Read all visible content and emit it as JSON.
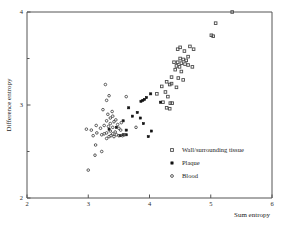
{
  "chart_data": {
    "type": "scatter",
    "title": "",
    "xlabel": "Sum entropy",
    "ylabel": "Difference entropy",
    "xlim": [
      2,
      6
    ],
    "ylim": [
      2,
      4
    ],
    "xticks": [
      2,
      3,
      4,
      5,
      6
    ],
    "yticks": [
      2,
      3,
      4
    ],
    "xticklabels": [
      "2",
      "3",
      "4",
      "5",
      "6"
    ],
    "yticklabels": [
      "2",
      "3",
      "4"
    ],
    "grid": false,
    "legend_position": "lower-right-inside",
    "series": [
      {
        "name": "Wall/surrounding tissue",
        "marker": "open-square",
        "color": "#4a4a4a",
        "points": [
          [
            5.35,
            4.0
          ],
          [
            5.08,
            3.88
          ],
          [
            5.01,
            3.75
          ],
          [
            5.04,
            3.74
          ],
          [
            4.66,
            3.63
          ],
          [
            4.72,
            3.6
          ],
          [
            4.5,
            3.62
          ],
          [
            4.46,
            3.6
          ],
          [
            4.57,
            3.58
          ],
          [
            4.63,
            3.52
          ],
          [
            4.5,
            3.5
          ],
          [
            4.55,
            3.49
          ],
          [
            4.6,
            3.48
          ],
          [
            4.46,
            3.46
          ],
          [
            4.52,
            3.45
          ],
          [
            4.58,
            3.44
          ],
          [
            4.63,
            3.43
          ],
          [
            4.44,
            3.42
          ],
          [
            4.4,
            3.46
          ],
          [
            4.49,
            3.41
          ],
          [
            4.42,
            3.38
          ],
          [
            4.52,
            3.36
          ],
          [
            4.7,
            3.41
          ],
          [
            4.36,
            3.3
          ],
          [
            4.47,
            3.29
          ],
          [
            4.55,
            3.27
          ],
          [
            4.28,
            3.25
          ],
          [
            4.33,
            3.22
          ],
          [
            4.2,
            3.2
          ],
          [
            4.44,
            3.19
          ],
          [
            4.26,
            3.14
          ],
          [
            4.12,
            3.12
          ],
          [
            4.36,
            3.23
          ],
          [
            4.3,
            3.09
          ],
          [
            4.22,
            3.03
          ],
          [
            4.34,
            3.02
          ],
          [
            4.37,
            3.02
          ],
          [
            4.28,
            2.97
          ],
          [
            4.33,
            2.96
          ]
        ]
      },
      {
        "name": "Plaque",
        "marker": "filled-square",
        "color": "#111111",
        "points": [
          [
            4.02,
            3.12
          ],
          [
            3.95,
            3.08
          ],
          [
            3.92,
            3.06
          ],
          [
            3.89,
            3.05
          ],
          [
            3.86,
            3.04
          ],
          [
            4.18,
            3.03
          ],
          [
            3.66,
            2.97
          ],
          [
            3.8,
            2.92
          ],
          [
            3.72,
            2.88
          ],
          [
            3.85,
            2.86
          ],
          [
            3.57,
            2.83
          ],
          [
            3.9,
            2.8
          ],
          [
            3.46,
            2.76
          ],
          [
            3.62,
            2.73
          ],
          [
            3.34,
            2.74
          ],
          [
            4.03,
            2.72
          ],
          [
            3.57,
            2.68
          ],
          [
            3.52,
            2.67
          ],
          [
            3.62,
            2.68
          ],
          [
            3.98,
            2.66
          ]
        ]
      },
      {
        "name": "Blood",
        "marker": "open-circle",
        "color": "#4a4a4a",
        "points": [
          [
            3.28,
            3.22
          ],
          [
            3.34,
            3.1
          ],
          [
            3.62,
            3.09
          ],
          [
            3.3,
            3.05
          ],
          [
            3.24,
            2.95
          ],
          [
            3.39,
            2.93
          ],
          [
            3.32,
            2.9
          ],
          [
            3.4,
            2.88
          ],
          [
            3.36,
            2.86
          ],
          [
            3.45,
            2.84
          ],
          [
            3.3,
            2.83
          ],
          [
            3.42,
            2.82
          ],
          [
            3.36,
            2.8
          ],
          [
            3.48,
            2.79
          ],
          [
            3.54,
            2.81
          ],
          [
            3.26,
            2.78
          ],
          [
            3.33,
            2.77
          ],
          [
            3.4,
            2.76
          ],
          [
            3.5,
            2.75
          ],
          [
            3.78,
            2.76
          ],
          [
            3.2,
            2.75
          ],
          [
            3.13,
            2.78
          ],
          [
            3.05,
            2.73
          ],
          [
            3.36,
            2.72
          ],
          [
            3.44,
            2.71
          ],
          [
            3.53,
            2.73
          ],
          [
            3.3,
            2.7
          ],
          [
            3.4,
            2.69
          ],
          [
            2.97,
            2.74
          ],
          [
            3.14,
            2.7
          ],
          [
            3.26,
            2.69
          ],
          [
            3.46,
            2.68
          ],
          [
            3.34,
            2.66
          ],
          [
            3.42,
            2.66
          ],
          [
            3.22,
            2.68
          ],
          [
            3.08,
            2.67
          ],
          [
            3.3,
            2.64
          ],
          [
            3.5,
            2.67
          ],
          [
            3.12,
            2.57
          ],
          [
            3.22,
            2.5
          ],
          [
            3.11,
            2.46
          ],
          [
            3.0,
            2.3
          ],
          [
            3.56,
            2.67
          ],
          [
            3.59,
            2.68
          ],
          [
            3.37,
            2.67
          ]
        ]
      }
    ]
  },
  "legend": {
    "entries": [
      {
        "label": "Wall/surrounding tissue",
        "marker": "open-square"
      },
      {
        "label": "Plaque",
        "marker": "filled-square"
      },
      {
        "label": "Blood",
        "marker": "open-circle"
      }
    ]
  }
}
